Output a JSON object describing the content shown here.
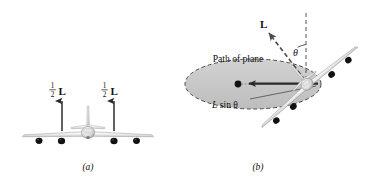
{
  "figure": {
    "title_hidden": "",
    "background_color": "#ffffff",
    "ink_color": "#1a1a1a",
    "ellipse_fill": "#c9c9c9",
    "plane_fill": "#f2f2f2",
    "engine_color": "#111111"
  },
  "panel_a": {
    "tag": "(a)",
    "view": "front view of level airplane",
    "force_label_left": {
      "numerator": "1",
      "denominator": "2",
      "vector": "L"
    },
    "force_label_right": {
      "numerator": "1",
      "denominator": "2",
      "vector": "L"
    },
    "arrow_direction": "up",
    "engine_count": 4
  },
  "panel_b": {
    "tag": "(b)",
    "view": "banked airplane in circular turn",
    "path_label": "Path of plane",
    "lift_vector_label": "L",
    "angle_label": "θ",
    "horizontal_component_label_italic": "L",
    "horizontal_component_label_rest": " sin θ",
    "bank_angle_degrees": 40,
    "engine_count": 4,
    "vertical_reference": "dashed vertical line",
    "path_outline": "dashed ellipse"
  }
}
